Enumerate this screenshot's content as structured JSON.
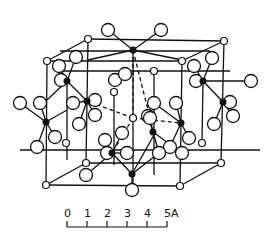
{
  "figure": {
    "type": "crystal-structure-unit-cell",
    "colors": {
      "ink": "#111111",
      "paper": "#ffffff"
    }
  },
  "scale_bar": {
    "ticks": [
      "0",
      "1",
      "2",
      "3",
      "4",
      "5A"
    ],
    "unit": "A"
  },
  "structure": {
    "cell_edges": [
      [
        47,
        61,
        88,
        39
      ],
      [
        88,
        39,
        224,
        41
      ],
      [
        224,
        41,
        182,
        61
      ],
      [
        182,
        61,
        47,
        61
      ],
      [
        47,
        61,
        46,
        185
      ],
      [
        182,
        61,
        180,
        186
      ],
      [
        224,
        41,
        221,
        163
      ],
      [
        88,
        39,
        86,
        163
      ],
      [
        46,
        185,
        180,
        186
      ],
      [
        180,
        186,
        221,
        163
      ],
      [
        221,
        163,
        86,
        163
      ],
      [
        86,
        163,
        46,
        185
      ],
      [
        67,
        81,
        67,
        160
      ],
      [
        203,
        81,
        202,
        143
      ],
      [
        133,
        50,
        133,
        185
      ],
      [
        20,
        150,
        260,
        150
      ],
      [
        60,
        51,
        210,
        51
      ],
      [
        60,
        71,
        230,
        71
      ],
      [
        114,
        92,
        114,
        165
      ],
      [
        154,
        71,
        154,
        175
      ]
    ],
    "bonds": [
      [
        133,
        50,
        108,
        30
      ],
      [
        133,
        50,
        161,
        30
      ],
      [
        133,
        50,
        88,
        60
      ],
      [
        133,
        50,
        182,
        60
      ],
      [
        67,
        81,
        59,
        66
      ],
      [
        67,
        81,
        76,
        57
      ],
      [
        67,
        81,
        61,
        80
      ],
      [
        67,
        81,
        47,
        100
      ],
      [
        203,
        81,
        194,
        66
      ],
      [
        203,
        81,
        212,
        58
      ],
      [
        203,
        81,
        196,
        81
      ],
      [
        203,
        81,
        251,
        81
      ],
      [
        203,
        81,
        223,
        102
      ],
      [
        46,
        122,
        20,
        103
      ],
      [
        46,
        122,
        40,
        103
      ],
      [
        46,
        122,
        37,
        147
      ],
      [
        46,
        122,
        55,
        137
      ],
      [
        46,
        122,
        67,
        110
      ],
      [
        87,
        101,
        73,
        103
      ],
      [
        87,
        101,
        95,
        100
      ],
      [
        87,
        101,
        95,
        115
      ],
      [
        87,
        101,
        79,
        124
      ],
      [
        87,
        101,
        67,
        81
      ],
      [
        223,
        102,
        230,
        102
      ],
      [
        223,
        102,
        233,
        116
      ],
      [
        223,
        102,
        214,
        124
      ],
      [
        181,
        123,
        176,
        103
      ],
      [
        181,
        123,
        189,
        138
      ],
      [
        181,
        123,
        170,
        147
      ],
      [
        181,
        123,
        154,
        103
      ],
      [
        112,
        153,
        105,
        140
      ],
      [
        112,
        153,
        122,
        133
      ],
      [
        112,
        153,
        107,
        153
      ],
      [
        112,
        153,
        127,
        153
      ],
      [
        112,
        153,
        132,
        174
      ],
      [
        112,
        153,
        86,
        175
      ],
      [
        132,
        174,
        132,
        190
      ],
      [
        132,
        174,
        159,
        153
      ],
      [
        132,
        174,
        154,
        135
      ],
      [
        153,
        132,
        148,
        116
      ],
      [
        153,
        132,
        159,
        153
      ],
      [
        153,
        132,
        182,
        153
      ]
    ],
    "dashed_bonds": [
      [
        133,
        50,
        133,
        118
      ],
      [
        133,
        50,
        150,
        118
      ],
      [
        133,
        118,
        87,
        101
      ],
      [
        133,
        118,
        181,
        123
      ],
      [
        133,
        118,
        112,
        153
      ],
      [
        150,
        118,
        153,
        132
      ]
    ],
    "black_atoms": [
      [
        133,
        50
      ],
      [
        67,
        81
      ],
      [
        203,
        81
      ],
      [
        46,
        122
      ],
      [
        87,
        101
      ],
      [
        223,
        102
      ],
      [
        181,
        123
      ],
      [
        153,
        132
      ],
      [
        112,
        153
      ],
      [
        132,
        174
      ]
    ],
    "small_atoms": [
      [
        88,
        39
      ],
      [
        224,
        41
      ],
      [
        47,
        61
      ],
      [
        182,
        61
      ],
      [
        114,
        92
      ],
      [
        154,
        71
      ],
      [
        66,
        143
      ],
      [
        202,
        143
      ],
      [
        86,
        163
      ],
      [
        221,
        163
      ],
      [
        46,
        185
      ],
      [
        180,
        186
      ],
      [
        133,
        118
      ]
    ],
    "large_atoms": [
      [
        108,
        30
      ],
      [
        161,
        30
      ],
      [
        59,
        66
      ],
      [
        76,
        57
      ],
      [
        61,
        80
      ],
      [
        115,
        80
      ],
      [
        125,
        74
      ],
      [
        194,
        66
      ],
      [
        212,
        58
      ],
      [
        196,
        81
      ],
      [
        251,
        81
      ],
      [
        20,
        103
      ],
      [
        40,
        103
      ],
      [
        37,
        147
      ],
      [
        55,
        137
      ],
      [
        73,
        103
      ],
      [
        95,
        100
      ],
      [
        95,
        115
      ],
      [
        79,
        124
      ],
      [
        230,
        102
      ],
      [
        233,
        116
      ],
      [
        214,
        124
      ],
      [
        154,
        103
      ],
      [
        176,
        103
      ],
      [
        148,
        116
      ],
      [
        189,
        138
      ],
      [
        170,
        147
      ],
      [
        182,
        153
      ],
      [
        159,
        153
      ],
      [
        105,
        140
      ],
      [
        122,
        133
      ],
      [
        107,
        153
      ],
      [
        127,
        153
      ],
      [
        86,
        175
      ],
      [
        132,
        190
      ],
      [
        150,
        118
      ]
    ]
  }
}
